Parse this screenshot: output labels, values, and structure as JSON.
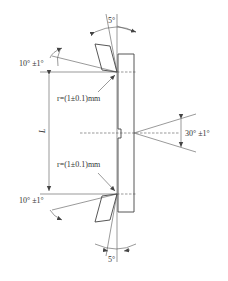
{
  "figure": {
    "type": "technical-drawing",
    "labels": {
      "top_clearance_angle": "5°",
      "bottom_clearance_angle": "5°",
      "top_rake_angle": "10° ±1°",
      "bottom_rake_angle": "10° ±1°",
      "top_radius": "r=(1±0.1)mm",
      "bottom_radius": "r=(1±0.1)mm",
      "length_dimension": "L",
      "notch_angle": "30° ±1°"
    },
    "colors": {
      "line": "#444444",
      "background": "#ffffff"
    }
  }
}
